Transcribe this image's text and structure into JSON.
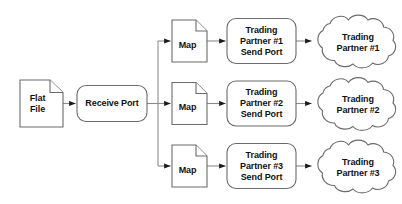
{
  "diagram": {
    "background_color": "#ffffff",
    "stroke_color": "#6b6b6b",
    "text_color": "#111111",
    "arrow_color": "#1a1a1a",
    "source": {
      "label": "Flat\nFile",
      "shape": "document"
    },
    "receive": {
      "label": "Receive Port",
      "shape": "rounded-rectangle"
    },
    "branches": [
      {
        "map_label": "Map",
        "send_port_label": "Trading\nPartner #1\nSend Port",
        "partner_label": "Trading\nPartner #1"
      },
      {
        "map_label": "Map",
        "send_port_label": "Trading\nPartner #2\nSend Port",
        "partner_label": "Trading\nPartner #2"
      },
      {
        "map_label": "Map",
        "send_port_label": "Trading\nPartner #3\nSend Port",
        "partner_label": "Trading\nPartner #3"
      }
    ]
  }
}
